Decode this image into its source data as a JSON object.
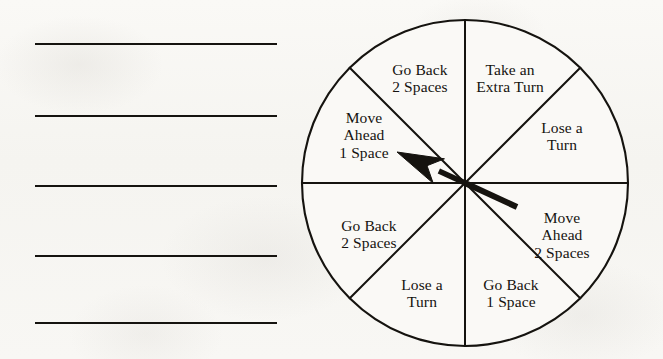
{
  "worksheet": {
    "answer_lines": [
      {
        "name": "answer-line-1",
        "x": 35,
        "y": 43,
        "width": 242
      },
      {
        "name": "answer-line-2",
        "x": 35,
        "y": 115,
        "width": 242
      },
      {
        "name": "answer-line-3",
        "x": 35,
        "y": 185,
        "width": 242
      },
      {
        "name": "answer-line-4",
        "x": 35,
        "y": 255,
        "width": 242
      },
      {
        "name": "answer-line-5",
        "x": 35,
        "y": 322,
        "width": 242
      }
    ]
  },
  "spinner": {
    "shape": "circle",
    "sector_count": 8,
    "center": {
      "x": 169,
      "y": 171
    },
    "radius": 163,
    "stroke_color": "#15130f",
    "fill_color": "#faf9f6",
    "pointer": {
      "name": "spinner-arrow",
      "direction_degrees": 152,
      "tip": {
        "x": 101,
        "y": 140
      },
      "tail": {
        "x": 221,
        "y": 195
      },
      "color": "#15130f"
    },
    "sectors": [
      {
        "index": 0,
        "name": "sector-take-an-extra-turn",
        "start_degrees": 45,
        "end_degrees": 90,
        "lines": [
          "Take an",
          "Extra Turn"
        ],
        "label_x": 214,
        "label_y": 66
      },
      {
        "index": 1,
        "name": "sector-lose-a-turn-upper-right",
        "start_degrees": 0,
        "end_degrees": 45,
        "lines": [
          "Lose a",
          "Turn"
        ],
        "label_x": 266,
        "label_y": 124
      },
      {
        "index": 2,
        "name": "sector-move-ahead-2-spaces",
        "start_degrees": -45,
        "end_degrees": 0,
        "lines": [
          "Move",
          "Ahead",
          "2 Spaces"
        ],
        "label_x": 266,
        "label_y": 223
      },
      {
        "index": 3,
        "name": "sector-go-back-1-space",
        "start_degrees": -90,
        "end_degrees": -45,
        "lines": [
          "Go Back",
          "1 Space"
        ],
        "label_x": 215,
        "label_y": 281
      },
      {
        "index": 4,
        "name": "sector-lose-a-turn-lower-left",
        "start_degrees": -135,
        "end_degrees": -90,
        "lines": [
          "Lose a",
          "Turn"
        ],
        "label_x": 126,
        "label_y": 281
      },
      {
        "index": 5,
        "name": "sector-go-back-2-spaces-lower-left",
        "start_degrees": 180,
        "end_degrees": -135,
        "lines": [
          "Go Back",
          "2 Spaces"
        ],
        "label_x": 73,
        "label_y": 222
      },
      {
        "index": 6,
        "name": "sector-move-ahead-1-space",
        "start_degrees": 135,
        "end_degrees": 180,
        "lines": [
          "Move",
          "Ahead",
          "1 Space"
        ],
        "label_x": 68,
        "label_y": 123
      },
      {
        "index": 7,
        "name": "sector-go-back-2-spaces-upper-left",
        "start_degrees": 90,
        "end_degrees": 135,
        "lines": [
          "Go Back",
          "2 Spaces"
        ],
        "label_x": 124,
        "label_y": 66
      }
    ]
  }
}
